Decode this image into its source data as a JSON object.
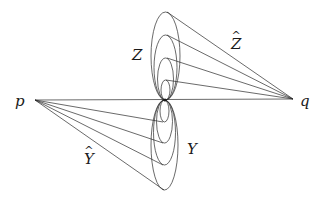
{
  "diagram": {
    "labels": {
      "p": "p",
      "q": "q",
      "Z": "Z",
      "Y": "Y",
      "Z_hat": "Z",
      "Y_hat": "Y",
      "hat_symbol": "^"
    },
    "points": {
      "p": [
        35,
        100
      ],
      "q": [
        293,
        99
      ],
      "center": [
        165,
        100
      ]
    },
    "upper_family": {
      "name": "Z",
      "ellipse_tops_y": [
        12,
        35,
        58,
        80
      ],
      "cone_apex": "q",
      "cone_label": "Z-hat"
    },
    "lower_family": {
      "name": "Y",
      "ellipse_bottoms_y": [
        122,
        143,
        165,
        190
      ],
      "cone_apex": "p",
      "cone_label": "Y-hat"
    },
    "colors": {
      "stroke": "#2a2a2a",
      "background": "#ffffff"
    }
  }
}
